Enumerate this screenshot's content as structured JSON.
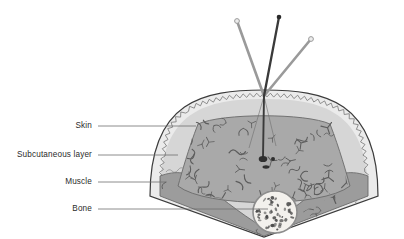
{
  "figure": {
    "width": 404,
    "height": 239,
    "background_color": "#ffffff"
  },
  "labels": [
    {
      "id": "skin",
      "text": "Skin",
      "text_x": 92,
      "text_y": 126,
      "leader_x1": 98,
      "leader_x2": 196,
      "leader_y": 126
    },
    {
      "id": "subcutaneous",
      "text": "Subcutaneous layer",
      "text_x": 92,
      "text_y": 155,
      "leader_x1": 98,
      "leader_x2": 178,
      "leader_y": 155
    },
    {
      "id": "muscle",
      "text": "Muscle",
      "text_x": 92,
      "text_y": 182,
      "leader_x1": 98,
      "leader_x2": 166,
      "leader_y": 182
    },
    {
      "id": "bone",
      "text": "Bone",
      "text_x": 92,
      "text_y": 209,
      "leader_x1": 98,
      "leader_x2": 268,
      "leader_y": 209
    }
  ],
  "layers": {
    "skin": {
      "name": "Skin",
      "fill": "#e9e9e9",
      "stroke": "#3c3c3c"
    },
    "subcutaneous": {
      "name": "Subcutaneous layer",
      "fill": "#d8d8d8",
      "stroke": "#6f6f6f"
    },
    "muscle": {
      "name": "Muscle",
      "fill": "#9d9d9d",
      "stroke": "#6a6a6a"
    },
    "fat_body": {
      "name": "Fat body",
      "fill": "#a8a8a8",
      "stroke": "#6a6a6a"
    },
    "bone": {
      "name": "Bone",
      "fill": "#f2f0ec",
      "stroke": "#8a8a8a"
    }
  },
  "instruments": [
    {
      "id": "needle-center",
      "name": "Central needle",
      "color": "#3a3a3a",
      "tip_color": "#2a2a2a",
      "x1": 279,
      "y1": 17,
      "x2": 264,
      "y2": 159
    },
    {
      "id": "instrument-left",
      "name": "Left instrument",
      "color": "#9a9a9a",
      "x1": 237,
      "y1": 21,
      "x2": 264,
      "y2": 96
    },
    {
      "id": "instrument-right",
      "name": "Right instrument",
      "color": "#9a9a9a",
      "x1": 311,
      "y1": 39,
      "x2": 264,
      "y2": 96
    }
  ],
  "markers": {
    "needle_tip_blob": {
      "cx": 263,
      "cy": 159,
      "rx": 4.2,
      "ry": 3.0,
      "color": "#2f2f2f"
    },
    "side_dot": {
      "cx": 273,
      "cy": 159,
      "r": 2.0,
      "color": "#2f2f2f"
    },
    "lower_oval": {
      "cx": 266,
      "cy": 167,
      "rx": 3.4,
      "ry": 1.6,
      "color": "#2f2f2f"
    }
  },
  "bone_marrow": {
    "center_x": 275,
    "center_y": 212,
    "radius_x": 22,
    "radius_y": 21,
    "speckle_count": 46,
    "speckle_color": "#4a4a4a"
  },
  "insertion_point": {
    "x": 264,
    "y": 96
  }
}
